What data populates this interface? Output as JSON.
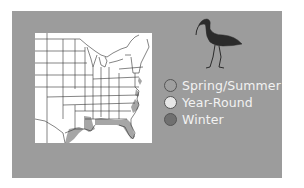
{
  "map": {
    "region": "Eastern United States",
    "icon": "bird-silhouette-icon (ibis)"
  },
  "legend": {
    "items": [
      {
        "label": "Spring/Summer",
        "color": "#a0a0a0"
      },
      {
        "label": "Year-Round",
        "color": "#e6e6e6"
      },
      {
        "label": "Winter",
        "color": "#707070"
      }
    ]
  },
  "colors": {
    "card": "#9c9c9c",
    "map_bg": "#ffffff",
    "range_fill": "#a6a6a6",
    "state_lines": "#333333",
    "legend_text": "#f2f2f2"
  }
}
